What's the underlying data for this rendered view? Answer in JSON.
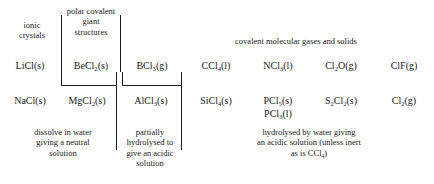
{
  "figure": {
    "kind": "chemistry-periodicity-chart"
  },
  "headings": {
    "ionic": "ionic\ncrystals",
    "polar_covalent": "polar covalent\ngiant\nstructures",
    "covalent_molecular": "covalent molecular gases and solids"
  },
  "rows": [
    {
      "id": "period-2",
      "cells": [
        {
          "id": "licl",
          "formula": "LiCl(s)",
          "parts": [
            {
              "t": "LiCl(s)"
            }
          ]
        },
        {
          "id": "becl2",
          "formula": "BeCl2(s)",
          "parts": [
            {
              "t": "BeCl"
            },
            {
              "t": "2",
              "sub": true
            },
            {
              "t": "(s)"
            }
          ]
        },
        {
          "id": "bcl3",
          "formula": "BCl3(g)",
          "parts": [
            {
              "t": "BCl"
            },
            {
              "t": "3",
              "sub": true
            },
            {
              "t": "(g)"
            }
          ]
        },
        {
          "id": "ccl4",
          "formula": "CCl4(l)",
          "parts": [
            {
              "t": "CCl"
            },
            {
              "t": "4",
              "sub": true
            },
            {
              "t": "(l)"
            }
          ]
        },
        {
          "id": "ncl3",
          "formula": "NCl3(l)",
          "parts": [
            {
              "t": "NCl"
            },
            {
              "t": "3",
              "sub": true
            },
            {
              "t": "(l)"
            }
          ]
        },
        {
          "id": "cl2o",
          "formula": "Cl2O(g)",
          "parts": [
            {
              "t": "Cl"
            },
            {
              "t": "2",
              "sub": true
            },
            {
              "t": "O(g)"
            }
          ]
        },
        {
          "id": "clf",
          "formula": "ClF(g)",
          "parts": [
            {
              "t": "ClF(g)"
            }
          ]
        }
      ]
    },
    {
      "id": "period-3",
      "cells": [
        {
          "id": "nacl",
          "formula": "NaCl(s)",
          "parts": [
            {
              "t": "NaCl(s)"
            }
          ]
        },
        {
          "id": "mgcl2",
          "formula": "MgCl2(s)",
          "parts": [
            {
              "t": "MgCl"
            },
            {
              "t": "2",
              "sub": true
            },
            {
              "t": "(s)"
            }
          ]
        },
        {
          "id": "alcl3",
          "formula": "AlCl3(s)",
          "parts": [
            {
              "t": "AlCl"
            },
            {
              "t": "3",
              "sub": true
            },
            {
              "t": "(s)"
            }
          ]
        },
        {
          "id": "sicl4",
          "formula": "SiCl4(s)",
          "parts": [
            {
              "t": "SiCl"
            },
            {
              "t": "4",
              "sub": true
            },
            {
              "t": "(s)"
            }
          ]
        },
        {
          "id": "pcl5",
          "formula": "PCl5(s)",
          "parts": [
            {
              "t": "PCl"
            },
            {
              "t": "5",
              "sub": true
            },
            {
              "t": "(s)"
            }
          ]
        },
        {
          "id": "s2cl2",
          "formula": "S2Cl2(s)",
          "parts": [
            {
              "t": "S"
            },
            {
              "t": "2",
              "sub": true
            },
            {
              "t": "Cl"
            },
            {
              "t": "2",
              "sub": true
            },
            {
              "t": "(s)"
            }
          ]
        },
        {
          "id": "cl2",
          "formula": "Cl2(g)",
          "parts": [
            {
              "t": "Cl"
            },
            {
              "t": "2",
              "sub": true
            },
            {
              "t": "(g)"
            }
          ]
        }
      ]
    }
  ],
  "extra_species": [
    {
      "id": "pcl3",
      "formula": "PCl3(l)",
      "parts": [
        {
          "t": "PCl"
        },
        {
          "t": "3",
          "sub": true
        },
        {
          "t": "(l)"
        }
      ]
    }
  ],
  "notes": {
    "neutral": "dissolve in water\ngiving a neutral\nsolution",
    "partial": "partially\nhydrolysed to\ngive an acidic\nsolution",
    "acidic_parts": [
      {
        "t": "hydrolysed by water giving"
      },
      {
        "br": true
      },
      {
        "t": "an acidic solution (unless inert"
      },
      {
        "br": true
      },
      {
        "t": "as is CCl"
      },
      {
        "t": "4",
        "sub": true
      },
      {
        "t": ")"
      }
    ]
  },
  "style": {
    "ink": "#1a1a1a",
    "paper": "#ffffff"
  }
}
